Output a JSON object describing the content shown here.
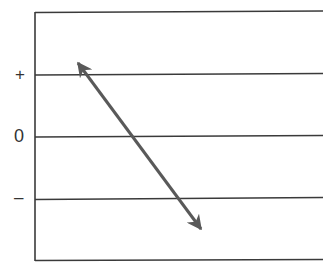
{
  "diagram": {
    "type": "axis-diagram",
    "labels": {
      "plus": "+",
      "zero": "0",
      "minus": "–"
    },
    "colors": {
      "lines": "#3a3a3a",
      "arrow": "#595959",
      "labels": "#333333"
    },
    "horizontal_lines": [
      {
        "name": "top-border",
        "y": 12
      },
      {
        "name": "plus-line",
        "y": 74
      },
      {
        "name": "zero-line",
        "y": 136
      },
      {
        "name": "minus-line",
        "y": 198
      },
      {
        "name": "bottom-border",
        "y": 260
      }
    ],
    "arrow": {
      "kind": "double-headed",
      "from": [
        76,
        60
      ],
      "to": [
        203,
        232
      ]
    }
  }
}
